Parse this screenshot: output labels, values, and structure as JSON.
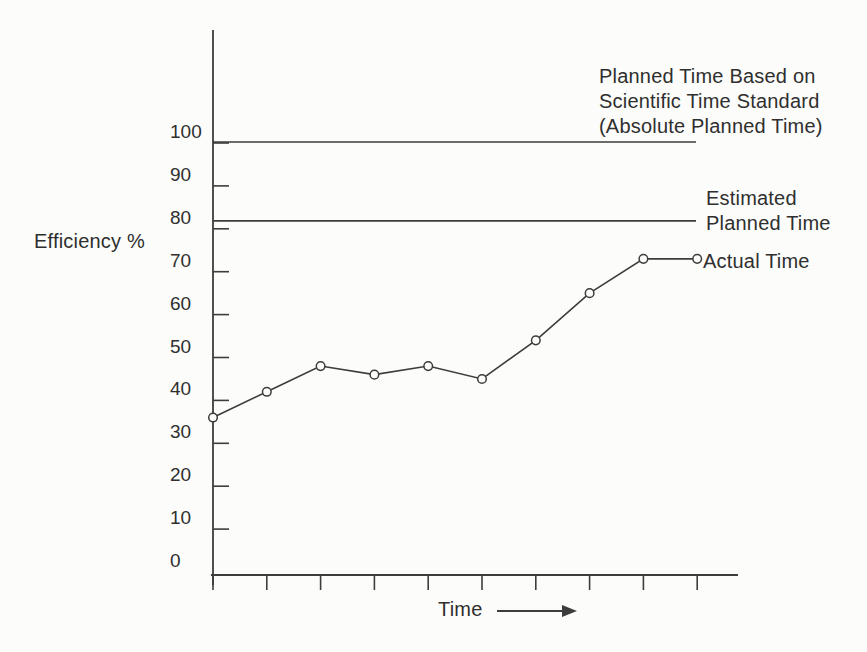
{
  "colors": {
    "ink": "#3d3d3d",
    "paper": "#fcfcfa"
  },
  "chart_data": {
    "type": "line",
    "title": "",
    "xlabel": "Time",
    "ylabel": "Efficiency %",
    "yticks": [
      0,
      10,
      20,
      30,
      40,
      50,
      60,
      70,
      80,
      90,
      100
    ],
    "ylim": [
      0,
      126
    ],
    "x_tick_count": 10,
    "x_tick_labels_shown": false,
    "grid": false,
    "legend_position": "inline-right",
    "series": [
      {
        "name": "Actual Time",
        "marker": "open-circle",
        "values": [
          36,
          42,
          48,
          46,
          48,
          45,
          54,
          65,
          73,
          73
        ]
      }
    ],
    "ref_lines": [
      {
        "value": 100,
        "label": "Planned Time Based on Scientific Time Standard (Absolute Planned Time)",
        "label_lines": [
          "Planned Time Based on",
          "Scientific Time Standard",
          "(Absolute Planned Time)"
        ]
      },
      {
        "value": 80,
        "label": "Estimated Planned Time",
        "label_lines": [
          "Estimated",
          "Planned Time"
        ]
      }
    ]
  }
}
